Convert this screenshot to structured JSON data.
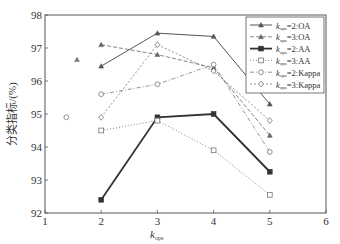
{
  "chart_data": {
    "type": "line",
    "title": "",
    "xlabel": "k",
    "xlabel_sub": "ops",
    "ylabel": "分类指标/(%)",
    "xlim": [
      1,
      6
    ],
    "ylim": [
      92,
      98
    ],
    "xticks": [
      1,
      2,
      3,
      4,
      5,
      6
    ],
    "yticks": [
      92,
      93,
      94,
      95,
      96,
      97,
      98
    ],
    "grid": false,
    "legend_position": "upper right",
    "x": [
      2,
      3,
      4,
      5
    ],
    "series": [
      {
        "name": "k_ops=2:OA",
        "label_sub": "ops",
        "label_rest": "=2:OA",
        "values": [
          96.45,
          97.45,
          97.35,
          95.3
        ],
        "marker": "triangle",
        "dash": "",
        "width": 1.0,
        "color": "#555555"
      },
      {
        "name": "k_ops=3:OA",
        "label_sub": "ops",
        "label_rest": "=3:OA",
        "values": [
          97.1,
          96.8,
          96.4,
          94.35
        ],
        "marker": "triangle",
        "dash": "4,2",
        "width": 0.8,
        "color": "#666666"
      },
      {
        "name": "k_ops=2:AA",
        "label_sub": "ops",
        "label_rest": "=2:AA",
        "values": [
          92.4,
          94.9,
          95.0,
          93.25
        ],
        "marker": "square-filled",
        "dash": "",
        "width": 1.8,
        "color": "#333333"
      },
      {
        "name": "k_ops=3:AA",
        "label_sub": "ops",
        "label_rest": "=3:AA",
        "values": [
          94.5,
          94.8,
          93.9,
          92.55
        ],
        "marker": "square",
        "dash": "1,2",
        "width": 0.9,
        "color": "#777777"
      },
      {
        "name": "k_ops=2:Kappa",
        "label_sub": "ops",
        "label_rest": "=2:Kappa",
        "values": [
          95.6,
          95.9,
          96.5,
          93.85
        ],
        "marker": "circle",
        "dash": "4,2,1,2",
        "width": 0.8,
        "color": "#777777"
      },
      {
        "name": "k_ops=3:Kappa",
        "label_sub": "ops",
        "label_rest": "=3:Kappa",
        "values": [
          94.9,
          97.1,
          96.3,
          94.8
        ],
        "marker": "diamond",
        "dash": "2,2",
        "width": 0.8,
        "color": "#777777"
      }
    ],
    "extra_points": [
      {
        "x": 1.38,
        "y": 94.9,
        "marker": "circle"
      },
      {
        "x": 1.57,
        "y": 96.65,
        "marker": "triangle"
      }
    ]
  }
}
